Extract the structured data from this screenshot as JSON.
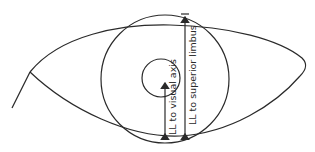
{
  "diagram": {
    "type": "eye measurement schematic",
    "labels": {
      "visual_axis": "LL to visual axis",
      "superior_limbus": "LL to superior limbus"
    },
    "elements": {
      "eye_outline": "almond-shaped eyelid outline",
      "limbus_circle": "large circle (cornea/limbus)",
      "pupil_circle": "small circle (pupil)",
      "arrow_visual_axis": "double-headed arrow from lower lid to visual axis",
      "arrow_superior_limbus": "double-headed arrow from lower lid to superior limbus"
    },
    "colors": {
      "line": "#2a2a2a",
      "background": "#ffffff"
    }
  }
}
